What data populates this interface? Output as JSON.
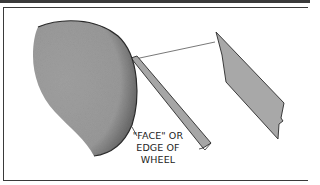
{
  "diagram": {
    "type": "technical-illustration",
    "label": {
      "line1": "\"FACE\" OR",
      "line2": "EDGE OF",
      "line3": "WHEEL"
    },
    "colors": {
      "wheel_fill": "#9a9a9a",
      "wheel_edge_shade": "#6e6e6e",
      "blade_fill": "#a8a8a8",
      "outline": "#2a2a2a",
      "frame": "#3a3a3a"
    },
    "elements": [
      {
        "name": "grinding-wheel",
        "description": "curved wheel shape with stippled edge"
      },
      {
        "name": "strip",
        "description": "thin angled strip touching wheel face"
      },
      {
        "name": "blade",
        "description": "angled blade/tool shape with notched end"
      },
      {
        "name": "guide-line",
        "description": "line connecting wheel edge to blade"
      },
      {
        "name": "leader-line",
        "description": "pointer from label to wheel edge"
      }
    ]
  }
}
